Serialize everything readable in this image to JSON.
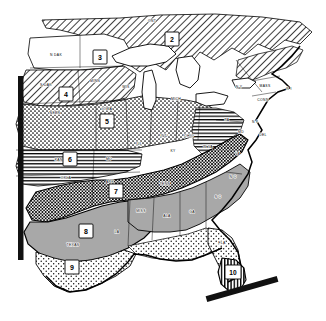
{
  "figure": {
    "kind": "thematic-map",
    "background_color": "#ffffff",
    "ink_color": "#000000"
  },
  "regions": [
    {
      "id": 2,
      "number": "2",
      "pattern": "diagonal-hatch",
      "x": 172,
      "y": 40,
      "area": "Ontario / Great Lakes north"
    },
    {
      "id": 3,
      "number": "3",
      "pattern": "white",
      "x": 100,
      "y": 58,
      "area": "Northern Plains"
    },
    {
      "id": 4,
      "number": "4",
      "pattern": "diagonal-hatch",
      "x": 66,
      "y": 95,
      "area": "Dakotas / Nebraska / Minnesota"
    },
    {
      "id": 5,
      "number": "5",
      "pattern": "stipple-dots",
      "x": 107,
      "y": 122,
      "area": "Corn Belt"
    },
    {
      "id": 6,
      "number": "6",
      "pattern": "horizontal-lines",
      "x": 70,
      "y": 160,
      "area": "Kansas / Missouri / Oklahoma"
    },
    {
      "id": 7,
      "number": "7",
      "pattern": "cross-hatch-dense",
      "x": 116,
      "y": 192,
      "area": "Mid-South / Appalachian"
    },
    {
      "id": 8,
      "number": "8",
      "pattern": "solid-gray",
      "x": 86,
      "y": 232,
      "area": "Texas / Gulf Coast"
    },
    {
      "id": 9,
      "number": "9",
      "pattern": "light-stipple",
      "x": 72,
      "y": 268,
      "area": "South Texas"
    },
    {
      "id": 10,
      "number": "10",
      "pattern": "vertical-lines",
      "x": 233,
      "y": 273,
      "area": "South Florida"
    }
  ],
  "state_labels": [
    {
      "text": "ONT",
      "x": 152,
      "y": 22
    },
    {
      "text": "N DAK",
      "x": 56,
      "y": 56
    },
    {
      "text": "S DAK",
      "x": 46,
      "y": 86
    },
    {
      "text": "MINN",
      "x": 95,
      "y": 82
    },
    {
      "text": "WIS",
      "x": 126,
      "y": 88
    },
    {
      "text": "MICH",
      "x": 176,
      "y": 100
    },
    {
      "text": "NEBR",
      "x": 55,
      "y": 114
    },
    {
      "text": "IOWA",
      "x": 107,
      "y": 110
    },
    {
      "text": "ILL",
      "x": 139,
      "y": 145
    },
    {
      "text": "IND",
      "x": 164,
      "y": 137
    },
    {
      "text": "OHIO",
      "x": 189,
      "y": 137
    },
    {
      "text": "KANS",
      "x": 60,
      "y": 161
    },
    {
      "text": "MO",
      "x": 109,
      "y": 160
    },
    {
      "text": "KY",
      "x": 173,
      "y": 152
    },
    {
      "text": "W VA",
      "x": 208,
      "y": 148
    },
    {
      "text": "OKLA",
      "x": 66,
      "y": 179
    },
    {
      "text": "ARK",
      "x": 110,
      "y": 183
    },
    {
      "text": "TENN",
      "x": 165,
      "y": 185
    },
    {
      "text": "N Y",
      "x": 239,
      "y": 88
    },
    {
      "text": "PA",
      "x": 227,
      "y": 121
    },
    {
      "text": "MASS",
      "x": 265,
      "y": 87
    },
    {
      "text": "R I",
      "x": 287,
      "y": 90
    },
    {
      "text": "CONN",
      "x": 263,
      "y": 101
    },
    {
      "text": "N J",
      "x": 253,
      "y": 123
    },
    {
      "text": "MD",
      "x": 241,
      "y": 133
    },
    {
      "text": "DEL",
      "x": 261,
      "y": 136
    },
    {
      "text": "VA",
      "x": 238,
      "y": 155
    },
    {
      "text": "N C",
      "x": 233,
      "y": 178
    },
    {
      "text": "S C",
      "x": 218,
      "y": 198
    },
    {
      "text": "GA",
      "x": 192,
      "y": 213
    },
    {
      "text": "ALA",
      "x": 167,
      "y": 217
    },
    {
      "text": "MISS",
      "x": 141,
      "y": 212
    },
    {
      "text": "LA",
      "x": 117,
      "y": 233
    },
    {
      "text": "TEXAS",
      "x": 73,
      "y": 246
    },
    {
      "text": "FLA",
      "x": 222,
      "y": 244
    }
  ],
  "markers": [
    {
      "name": "left-edge-bar",
      "kind": "thick-black-bar"
    },
    {
      "name": "florida-tip-bar",
      "kind": "thick-black-bar"
    }
  ]
}
